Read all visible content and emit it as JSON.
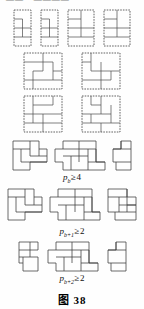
{
  "page": {
    "bleed_text": "——  •  ————",
    "caption": "图 38",
    "ink_color": "#3c3c3c",
    "background": "#fefefe"
  },
  "labels": [
    {
      "id": "label-pb",
      "symbol": "p",
      "subscript": "b",
      "relation": "≥",
      "value": "4",
      "text": "pₑ ≥ 4"
    },
    {
      "id": "label-pb1",
      "symbol": "p",
      "subscript": "b+1",
      "relation": "≥",
      "value": "2",
      "text": "pₑ₊₁ ≥ 2"
    },
    {
      "id": "label-pb2",
      "symbol": "p",
      "subscript": "b+2",
      "relation": "≥",
      "value": "2",
      "text": "pₑ₊₂ ≥ 2"
    }
  ],
  "sections": [
    {
      "id": "dashed-section",
      "style": "dashed-border-tilings",
      "rows": [
        {
          "id": "dashed-row-1",
          "figure_count": 4,
          "figures": [
            {
              "id": "d1",
              "shape": "tall-rect",
              "cols": 2,
              "rows": 4
            },
            {
              "id": "d2",
              "shape": "tall-rect",
              "cols": 2,
              "rows": 4
            },
            {
              "id": "d3",
              "shape": "rect",
              "cols": 3,
              "rows": 4
            },
            {
              "id": "d4",
              "shape": "rect",
              "cols": 3,
              "rows": 4
            }
          ]
        },
        {
          "id": "dashed-row-2",
          "figure_count": 2,
          "figures": [
            {
              "id": "d5",
              "shape": "square",
              "cols": 4,
              "rows": 4
            },
            {
              "id": "d6",
              "shape": "square",
              "cols": 4,
              "rows": 4
            }
          ]
        },
        {
          "id": "dashed-row-3",
          "figure_count": 2,
          "figures": [
            {
              "id": "d7",
              "shape": "square",
              "cols": 4,
              "rows": 4
            },
            {
              "id": "d8",
              "shape": "square",
              "cols": 4,
              "rows": 4
            }
          ]
        }
      ]
    },
    {
      "id": "solid-section-pb",
      "style": "solid-tilings",
      "figure_count": 3,
      "figures": [
        {
          "id": "s1",
          "shape": "staircase-block"
        },
        {
          "id": "s2",
          "shape": "wide-tiling"
        },
        {
          "id": "s3",
          "shape": "narrow-strip"
        }
      ]
    },
    {
      "id": "solid-section-pb1",
      "style": "solid-tilings",
      "figure_count": 3,
      "figures": [
        {
          "id": "s4",
          "shape": "staircase-block"
        },
        {
          "id": "s5",
          "shape": "wide-tiling"
        },
        {
          "id": "s6",
          "shape": "medium-block"
        }
      ]
    },
    {
      "id": "solid-section-pb2",
      "style": "solid-tilings",
      "figure_count": 3,
      "figures": [
        {
          "id": "s7",
          "shape": "narrow-step"
        },
        {
          "id": "s8",
          "shape": "wide-tiling"
        },
        {
          "id": "s9",
          "shape": "narrow-step-right"
        }
      ]
    }
  ]
}
